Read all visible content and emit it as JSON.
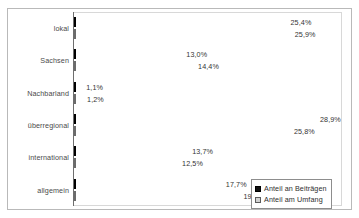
{
  "chart_data": {
    "type": "bar",
    "orientation": "horizontal",
    "title": "",
    "subtitle": "",
    "xlabel": "",
    "ylabel": "",
    "grid": false,
    "xlim": [
      0,
      32
    ],
    "axis_tick_labels": [],
    "legend_position": "bottom-right",
    "value_suffix": "%",
    "decimal_separator": ",",
    "categories": [
      "lokal",
      "Sachsen",
      "Nachbarland",
      "überregional",
      "international",
      "allgemein"
    ],
    "series": [
      {
        "name": "Anteil an Beiträgen",
        "color": "#171717",
        "values": [
          25.4,
          13.0,
          1.1,
          28.9,
          13.7,
          17.7
        ],
        "labels": [
          "25,4%",
          "13,0%",
          "1,1%",
          "28,9%",
          "13,7%",
          "17,7%"
        ]
      },
      {
        "name": "Anteil am Umfang",
        "color": "#d2d2d2",
        "values": [
          25.9,
          14.4,
          1.2,
          25.8,
          12.5,
          19.8
        ],
        "labels": [
          "25,9%",
          "14,4%",
          "1,2%",
          "25,8%",
          "12,5%",
          "19,8%"
        ]
      }
    ]
  },
  "legend": {
    "entries": [
      {
        "label": "Anteil an Beiträgen"
      },
      {
        "label": "Anteil am Umfang"
      }
    ]
  }
}
